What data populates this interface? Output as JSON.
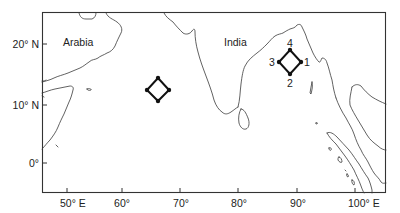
{
  "map": {
    "region_labels": {
      "arabia": "Arabia",
      "india": "India"
    },
    "latitude_labels": [
      "20° N",
      "10° N",
      "0°"
    ],
    "longitude_labels": [
      "50° E",
      "60°",
      "70°",
      "80°",
      "90°",
      "100° E"
    ],
    "arrays": [
      {
        "name": "Arabian Sea array",
        "center": "~66° E, ~12.5° N",
        "element_labels": []
      },
      {
        "name": "Bay of Bengal array",
        "center": "~89° E, ~17° N",
        "element_labels": [
          "1",
          "2",
          "3",
          "4"
        ]
      }
    ],
    "colors": {
      "line": "#333333",
      "background": "#ffffff"
    }
  }
}
